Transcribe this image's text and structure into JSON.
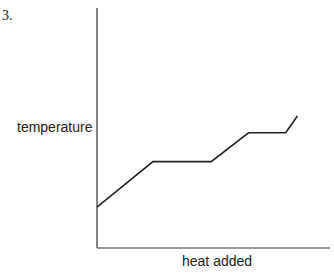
{
  "question_number": "3.",
  "chart_data": {
    "type": "line",
    "title": "",
    "xlabel": "heat added",
    "ylabel": "temperature",
    "grid": false,
    "legend": null,
    "ticks": false,
    "x": [
      0,
      0.24,
      0.49,
      0.65,
      0.81,
      0.86
    ],
    "series": [
      {
        "name": "heating curve",
        "values": [
          0.17,
          0.36,
          0.36,
          0.48,
          0.48,
          0.55
        ]
      }
    ],
    "xlim": [
      0,
      1
    ],
    "ylim": [
      0,
      1
    ],
    "annotations": [
      "Heating curve: slope, plateau (phase change), slope, plateau (phase change), slope"
    ]
  },
  "colors": {
    "line": "#222222",
    "axis": "#333333"
  }
}
